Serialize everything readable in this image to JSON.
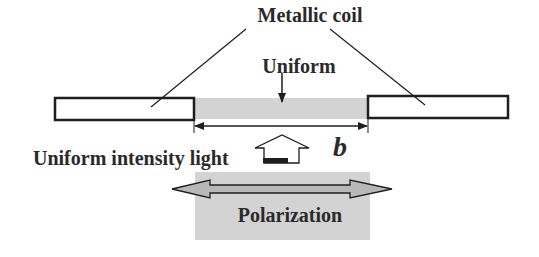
{
  "diagram": {
    "labels": {
      "metallic_coil": "Metallic coil",
      "uniform": "Uniform",
      "uniform_intensity_light": "Uniform intensity light",
      "gap_width": "b",
      "polarization": "Polarization"
    },
    "colors": {
      "shading": "#d3d3d3",
      "stroke": "#1e1e1e",
      "arrow_fill": "#b8b8b8",
      "text": "#2a2a2a"
    }
  }
}
